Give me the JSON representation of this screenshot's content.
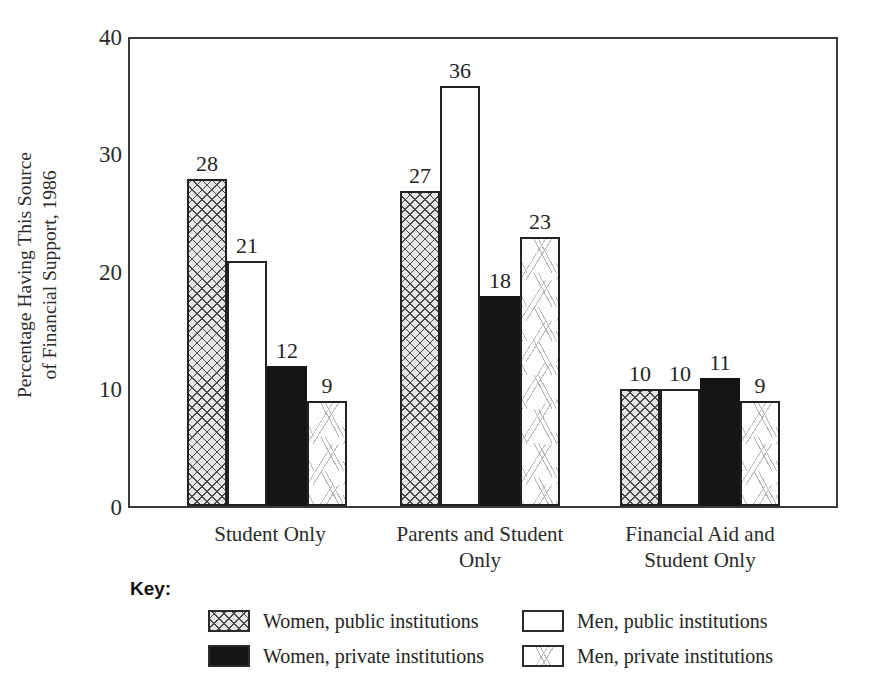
{
  "chart_data": {
    "type": "bar",
    "title": "",
    "xlabel": "",
    "ylabel": "Percentage Having This Source\nof Financial Support, 1986",
    "ylim": [
      0,
      40
    ],
    "yticks": [
      0,
      10,
      20,
      30,
      40
    ],
    "grid": false,
    "legend_position": "bottom",
    "categories": [
      "Student Only",
      "Parents and Student\nOnly",
      "Financial Aid and\nStudent Only"
    ],
    "series": [
      {
        "name": "Women, public institutions",
        "pattern": "crosshatch",
        "values": [
          28,
          27,
          10
        ]
      },
      {
        "name": "Men, public institutions",
        "pattern": "white",
        "values": [
          21,
          36,
          10
        ]
      },
      {
        "name": "Women, private institutions",
        "pattern": "black",
        "values": [
          12,
          18,
          11
        ]
      },
      {
        "name": "Men, private institutions",
        "pattern": "dashes",
        "values": [
          9,
          23,
          9
        ]
      }
    ]
  },
  "axis": {
    "y_tick_labels": [
      "40",
      "30",
      "20",
      "10",
      "0"
    ],
    "y_title_line1": "Percentage Having This Source",
    "y_title_line2": "of Financial Support, 1986"
  },
  "bar_labels": {
    "g0": [
      "28",
      "21",
      "12",
      "9"
    ],
    "g1": [
      "27",
      "36",
      "18",
      "23"
    ],
    "g2": [
      "10",
      "10",
      "11",
      "9"
    ]
  },
  "categories": {
    "c0": "Student Only",
    "c1": "Parents and Student\nOnly",
    "c2": "Financial Aid and\nStudent Only"
  },
  "legend": {
    "title": "Key:",
    "left": [
      {
        "label": "Women, public institutions"
      },
      {
        "label": "Women, private institutions"
      }
    ],
    "right": [
      {
        "label": "Men, public institutions"
      },
      {
        "label": "Men, private institutions"
      }
    ]
  },
  "colors": {
    "frame": "#3a3a3a",
    "bar_outline": "#222222",
    "black_fill": "#151515",
    "crosshatch_fill": "#e6e6e6",
    "text": "#242424",
    "background": "#ffffff"
  }
}
